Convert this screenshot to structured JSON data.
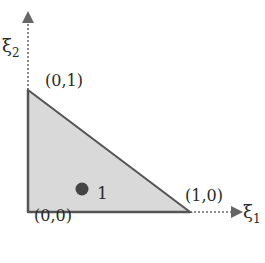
{
  "diagram": {
    "type": "reference-triangle",
    "colors": {
      "fill": "#d9d9d9",
      "edge": "#555555",
      "axis": "#666666",
      "point": "#444444",
      "text": "#2a2a2a"
    },
    "axes": {
      "x_label": "ξ",
      "x_sub": "1",
      "y_label": "ξ",
      "y_sub": "2"
    },
    "vertices": [
      {
        "label": "(0,0)"
      },
      {
        "label": "(1,0)"
      },
      {
        "label": "(0,1)"
      }
    ],
    "point": {
      "label": "1"
    }
  }
}
